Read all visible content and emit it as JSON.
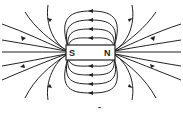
{
  "diagram": {
    "magnet": {
      "left_pole_label": "S",
      "right_pole_label": "N"
    },
    "caption_mark": "-",
    "colors": {
      "line": "#222222",
      "background": "#ffffff"
    }
  }
}
